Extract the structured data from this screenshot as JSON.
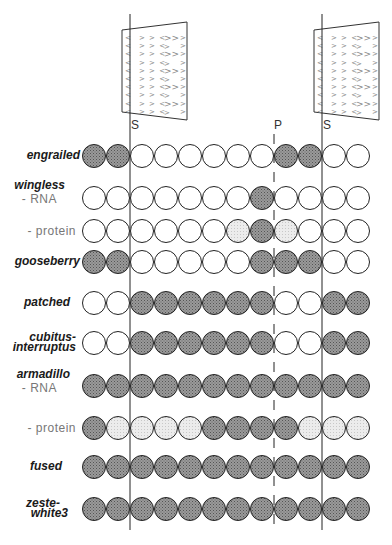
{
  "figure": {
    "markers": {
      "segment_left": {
        "label": "S",
        "x": 130
      },
      "parasegment": {
        "label": "P",
        "x": 274
      },
      "segment_right": {
        "label": "S",
        "x": 322
      }
    },
    "denticle_belts": [
      {
        "name": "denticle-belt-left",
        "x_left": 122,
        "x_right": 187
      },
      {
        "name": "denticle-belt-right",
        "x_left": 314,
        "x_right": 379
      }
    ],
    "legend_states": {
      "D": "expressed (dark)",
      "L": "weakly expressed (light)",
      "W": "not expressed (white)"
    },
    "colors": {
      "dark": "#8c8c8c",
      "light": "#e4e4e4",
      "white": "#ffffff",
      "stroke": "#222222"
    },
    "cells_per_row": 12,
    "rows": [
      {
        "gene": "engrailed",
        "sub": "",
        "y": 156,
        "cells": [
          "D",
          "D",
          "W",
          "W",
          "W",
          "W",
          "W",
          "W",
          "D",
          "D",
          "W",
          "W"
        ]
      },
      {
        "gene": "wingless",
        "sub": "- RNA",
        "y": 198,
        "cells": [
          "W",
          "W",
          "W",
          "W",
          "W",
          "W",
          "W",
          "D",
          "W",
          "W",
          "W",
          "W"
        ]
      },
      {
        "gene": "",
        "sub": "- protein",
        "y": 231,
        "cells": [
          "W",
          "W",
          "W",
          "W",
          "W",
          "W",
          "L",
          "D",
          "L",
          "W",
          "W",
          "W"
        ]
      },
      {
        "gene": "gooseberry",
        "sub": "",
        "y": 262,
        "cells": [
          "D",
          "D",
          "W",
          "W",
          "W",
          "W",
          "W",
          "D",
          "D",
          "D",
          "W",
          "W"
        ]
      },
      {
        "gene": "patched",
        "sub": "",
        "y": 303,
        "cells": [
          "W",
          "W",
          "D",
          "D",
          "D",
          "D",
          "D",
          "D",
          "W",
          "W",
          "D",
          "D"
        ]
      },
      {
        "gene": "cubitus-\ninterruptus",
        "sub": "",
        "y": 343,
        "cells": [
          "W",
          "W",
          "D",
          "D",
          "D",
          "D",
          "D",
          "D",
          "W",
          "W",
          "D",
          "D"
        ]
      },
      {
        "gene": "armadillo",
        "sub": "- RNA",
        "y": 386,
        "cells": [
          "D",
          "D",
          "D",
          "D",
          "D",
          "D",
          "D",
          "D",
          "D",
          "D",
          "D",
          "D"
        ]
      },
      {
        "gene": "",
        "sub": "- protein",
        "y": 428,
        "cells": [
          "D",
          "L",
          "L",
          "L",
          "L",
          "D",
          "D",
          "D",
          "D",
          "L",
          "L",
          "L"
        ]
      },
      {
        "gene": "fused",
        "sub": "",
        "y": 467,
        "cells": [
          "D",
          "D",
          "D",
          "D",
          "D",
          "D",
          "D",
          "D",
          "D",
          "D",
          "D",
          "D"
        ]
      },
      {
        "gene": "zeste-\nwhite3",
        "sub": "",
        "y": 509,
        "cells": [
          "D",
          "D",
          "D",
          "D",
          "D",
          "D",
          "D",
          "D",
          "D",
          "D",
          "D",
          "D"
        ]
      }
    ],
    "labels": {
      "engrailed": "engrailed",
      "wingless": "wingless",
      "wingless_rna": "- RNA",
      "wingless_protein": "- protein",
      "gooseberry": "gooseberry",
      "patched": "patched",
      "cubitus_1": "cubitus-",
      "cubitus_2": "interruptus",
      "armadillo": "armadillo",
      "armadillo_rna": "- RNA",
      "armadillo_protein": "- protein",
      "fused": "fused",
      "zeste_1": "zeste-",
      "zeste_2": "white3"
    }
  }
}
